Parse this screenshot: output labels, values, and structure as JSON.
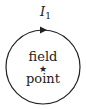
{
  "diagram": {
    "current_label": "I",
    "current_subscript": "1",
    "center_text_line1": "field",
    "center_text_line2": "point",
    "center_marker": "star",
    "loop_direction": "clockwise",
    "stroke_color": "#222222"
  }
}
